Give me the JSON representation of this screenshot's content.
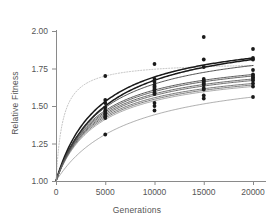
{
  "chart_data": {
    "type": "line",
    "title": "",
    "xlabel": "Generations",
    "ylabel": "Relative Fitness",
    "xlim": [
      0,
      21000
    ],
    "ylim": [
      0.96,
      2.06
    ],
    "xticks": [
      0,
      5000,
      10000,
      15000,
      20000
    ],
    "xticklabels": [
      "0",
      "5000",
      "10000",
      "15000",
      "20000"
    ],
    "yticks": [
      1.0,
      1.25,
      1.5,
      1.75,
      2.0
    ],
    "yticklabels": [
      "1.00",
      "1.25",
      "1.50",
      "1.75",
      "2.00"
    ],
    "grid": false,
    "legend": null,
    "x": [
      0,
      5000,
      10000,
      15000,
      20000
    ],
    "series": [
      {
        "name": "population-1",
        "values": [
          1.0,
          1.7,
          1.74,
          1.76,
          1.77
        ],
        "style": "dotted-light",
        "color": "#b8b8b8"
      },
      {
        "name": "population-2",
        "values": [
          1.0,
          1.53,
          1.68,
          1.77,
          1.82
        ],
        "style": "solid-bold",
        "color": "#1a1a1a"
      },
      {
        "name": "population-3",
        "values": [
          1.0,
          1.5,
          1.66,
          1.75,
          1.81
        ],
        "style": "solid-bold",
        "color": "#1a1a1a"
      },
      {
        "name": "population-4",
        "values": [
          1.0,
          1.49,
          1.64,
          1.72,
          1.77
        ],
        "style": "solid",
        "color": "#333333"
      },
      {
        "name": "population-5",
        "values": [
          1.0,
          1.47,
          1.62,
          1.68,
          1.71
        ],
        "style": "solid",
        "color": "#3a3a3a"
      },
      {
        "name": "population-6",
        "values": [
          1.0,
          1.46,
          1.61,
          1.67,
          1.7
        ],
        "style": "solid",
        "color": "#444444"
      },
      {
        "name": "population-7",
        "values": [
          1.0,
          1.45,
          1.59,
          1.65,
          1.68
        ],
        "style": "solid",
        "color": "#4d4d4d"
      },
      {
        "name": "population-8",
        "values": [
          1.0,
          1.44,
          1.58,
          1.64,
          1.67
        ],
        "style": "solid",
        "color": "#555555"
      },
      {
        "name": "population-9",
        "values": [
          1.0,
          1.43,
          1.57,
          1.62,
          1.65
        ],
        "style": "solid",
        "color": "#5c5c5c"
      },
      {
        "name": "population-10",
        "values": [
          1.0,
          1.42,
          1.56,
          1.61,
          1.64
        ],
        "style": "solid",
        "color": "#666666"
      },
      {
        "name": "population-11",
        "values": [
          1.0,
          1.41,
          1.54,
          1.6,
          1.63
        ],
        "style": "solid-thin",
        "color": "#707070"
      },
      {
        "name": "population-12",
        "values": [
          1.0,
          1.31,
          1.45,
          1.52,
          1.56
        ],
        "style": "solid-thin",
        "color": "#787878"
      }
    ],
    "scatter": {
      "name": "observed-fitness-assays",
      "marker": "filled-circle",
      "color": "#1a1a1a",
      "points": [
        {
          "x": 5000,
          "y": 1.7
        },
        {
          "x": 5000,
          "y": 1.54
        },
        {
          "x": 5000,
          "y": 1.52
        },
        {
          "x": 5000,
          "y": 1.49
        },
        {
          "x": 5000,
          "y": 1.47
        },
        {
          "x": 5000,
          "y": 1.46
        },
        {
          "x": 5000,
          "y": 1.45
        },
        {
          "x": 5000,
          "y": 1.44
        },
        {
          "x": 5000,
          "y": 1.43
        },
        {
          "x": 5000,
          "y": 1.42
        },
        {
          "x": 5000,
          "y": 1.31
        },
        {
          "x": 10000,
          "y": 1.78
        },
        {
          "x": 10000,
          "y": 1.68
        },
        {
          "x": 10000,
          "y": 1.66
        },
        {
          "x": 10000,
          "y": 1.64
        },
        {
          "x": 10000,
          "y": 1.63
        },
        {
          "x": 10000,
          "y": 1.62
        },
        {
          "x": 10000,
          "y": 1.61
        },
        {
          "x": 10000,
          "y": 1.59
        },
        {
          "x": 10000,
          "y": 1.58
        },
        {
          "x": 10000,
          "y": 1.52
        },
        {
          "x": 10000,
          "y": 1.5
        },
        {
          "x": 10000,
          "y": 1.47
        },
        {
          "x": 15000,
          "y": 1.96
        },
        {
          "x": 15000,
          "y": 1.81
        },
        {
          "x": 15000,
          "y": 1.76
        },
        {
          "x": 15000,
          "y": 1.68
        },
        {
          "x": 15000,
          "y": 1.67
        },
        {
          "x": 15000,
          "y": 1.66
        },
        {
          "x": 15000,
          "y": 1.65
        },
        {
          "x": 15000,
          "y": 1.64
        },
        {
          "x": 15000,
          "y": 1.62
        },
        {
          "x": 15000,
          "y": 1.61
        },
        {
          "x": 15000,
          "y": 1.57
        },
        {
          "x": 15000,
          "y": 1.55
        },
        {
          "x": 20000,
          "y": 1.88
        },
        {
          "x": 20000,
          "y": 1.82
        },
        {
          "x": 20000,
          "y": 1.81
        },
        {
          "x": 20000,
          "y": 1.74
        },
        {
          "x": 20000,
          "y": 1.71
        },
        {
          "x": 20000,
          "y": 1.7
        },
        {
          "x": 20000,
          "y": 1.69
        },
        {
          "x": 20000,
          "y": 1.68
        },
        {
          "x": 20000,
          "y": 1.67
        },
        {
          "x": 20000,
          "y": 1.65
        },
        {
          "x": 20000,
          "y": 1.63
        },
        {
          "x": 20000,
          "y": 1.56
        }
      ]
    }
  }
}
